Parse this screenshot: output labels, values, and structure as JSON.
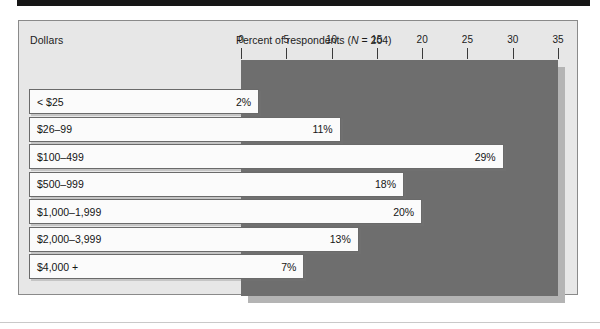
{
  "figure": {
    "group_axis_title": "Dollars",
    "chart_title_prefix": "Percent of respondents (",
    "chart_title_italic": "N",
    "chart_title_suffix": " = 204)"
  },
  "colors": {
    "panel": "#6e6e6e",
    "panel_shadow": "#b4b4b4",
    "frame_background": "#e7e7e7",
    "frame_border": "#8a8a8a",
    "bar_fill": "#fbfbfb",
    "bar_border": "#6a6a6a",
    "text": "#151515"
  },
  "chart_data": {
    "type": "bar",
    "orientation": "horizontal",
    "title": "Percent of respondents (N = 204)",
    "xlabel": "Percent of respondents",
    "ylabel": "Dollars",
    "xlim": [
      0,
      35
    ],
    "xticks": [
      0,
      5,
      10,
      15,
      20,
      25,
      30,
      35
    ],
    "xtick_labels": [
      "0",
      "5",
      "10",
      "15",
      "20",
      "25",
      "30",
      "35"
    ],
    "grid": false,
    "legend": false,
    "n": 204,
    "categories": [
      "< $25",
      "$26–99",
      "$100–499",
      "$500–999",
      "$1,000–1,999",
      "$2,000–3,999",
      "$4,000 +"
    ],
    "values": [
      2,
      11,
      29,
      18,
      20,
      13,
      7
    ],
    "value_labels": [
      "2%",
      "11%",
      "29%",
      "18%",
      "20%",
      "13%",
      "7%"
    ]
  }
}
